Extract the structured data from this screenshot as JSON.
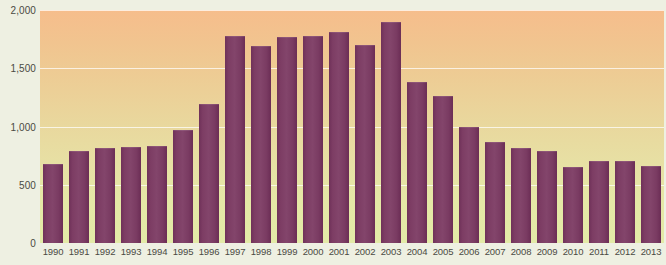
{
  "chart_data": {
    "type": "bar",
    "title": "",
    "subtitle": "",
    "xlabel": "",
    "ylabel": "",
    "categories": [
      "1990",
      "1991",
      "1992",
      "1993",
      "1994",
      "1995",
      "1996",
      "1997",
      "1998",
      "1999",
      "2000",
      "2001",
      "2002",
      "2003",
      "2004",
      "2005",
      "2006",
      "2007",
      "2008",
      "2009",
      "2010",
      "2011",
      "2012",
      "2013"
    ],
    "values": [
      680,
      790,
      815,
      825,
      830,
      970,
      1190,
      1780,
      1690,
      1770,
      1780,
      1810,
      1700,
      1900,
      1380,
      1260,
      1000,
      870,
      815,
      790,
      655,
      700,
      700,
      665
    ],
    "ylim": [
      0,
      2000
    ],
    "ytick_values": [
      0,
      500,
      1000,
      1500,
      2000
    ],
    "ytick_labels": [
      "0",
      "500",
      "1,000",
      "1,500",
      "2,000"
    ],
    "grid": true,
    "gridlines_at": [
      500,
      1000,
      1500,
      2000
    ],
    "legend": null,
    "legend_position": "none",
    "series": [
      {
        "name": "",
        "values": [
          680,
          790,
          815,
          825,
          830,
          970,
          1190,
          1780,
          1690,
          1770,
          1780,
          1810,
          1700,
          1900,
          1380,
          1260,
          1000,
          870,
          815,
          790,
          655,
          700,
          700,
          665
        ]
      }
    ],
    "colors": {
      "bar": "#7d3d64",
      "bar_dark": "#6b2d55",
      "bar_light": "#83456b",
      "plot_top": "#f6bd8c",
      "plot_bottom": "#e3eaa7",
      "page_background": "#eef0e2",
      "gridline": "#ffffff",
      "axis_text": "#4a4a42"
    }
  }
}
